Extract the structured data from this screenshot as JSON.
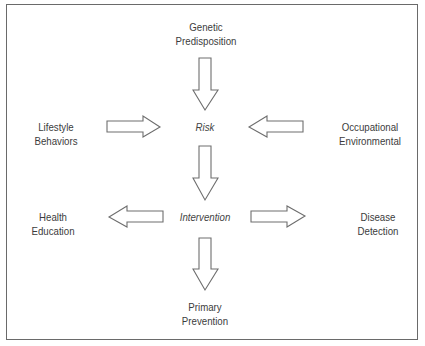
{
  "diagram": {
    "nodes": {
      "genetic": {
        "line1": "Genetic",
        "line2": "Predisposition"
      },
      "lifestyle": {
        "line1": "Lifestyle",
        "line2": "Behaviors"
      },
      "occupational": {
        "line1": "Occupational",
        "line2": "Environmental"
      },
      "risk": "Risk",
      "intervention": "Intervention",
      "health": {
        "line1": "Health",
        "line2": "Education"
      },
      "disease": {
        "line1": "Disease",
        "line2": "Detection"
      },
      "primary": {
        "line1": "Primary",
        "line2": "Prevention"
      }
    },
    "edges": [
      {
        "from": "Genetic Predisposition",
        "to": "Risk"
      },
      {
        "from": "Lifestyle Behaviors",
        "to": "Risk"
      },
      {
        "from": "Occupational Environmental",
        "to": "Risk"
      },
      {
        "from": "Risk",
        "to": "Intervention"
      },
      {
        "from": "Intervention",
        "to": "Health Education"
      },
      {
        "from": "Intervention",
        "to": "Disease Detection"
      },
      {
        "from": "Intervention",
        "to": "Primary Prevention"
      }
    ],
    "colors": {
      "stroke": "#6e6e6e",
      "text": "#3c3c3c",
      "border": "#6a6a6a"
    }
  }
}
